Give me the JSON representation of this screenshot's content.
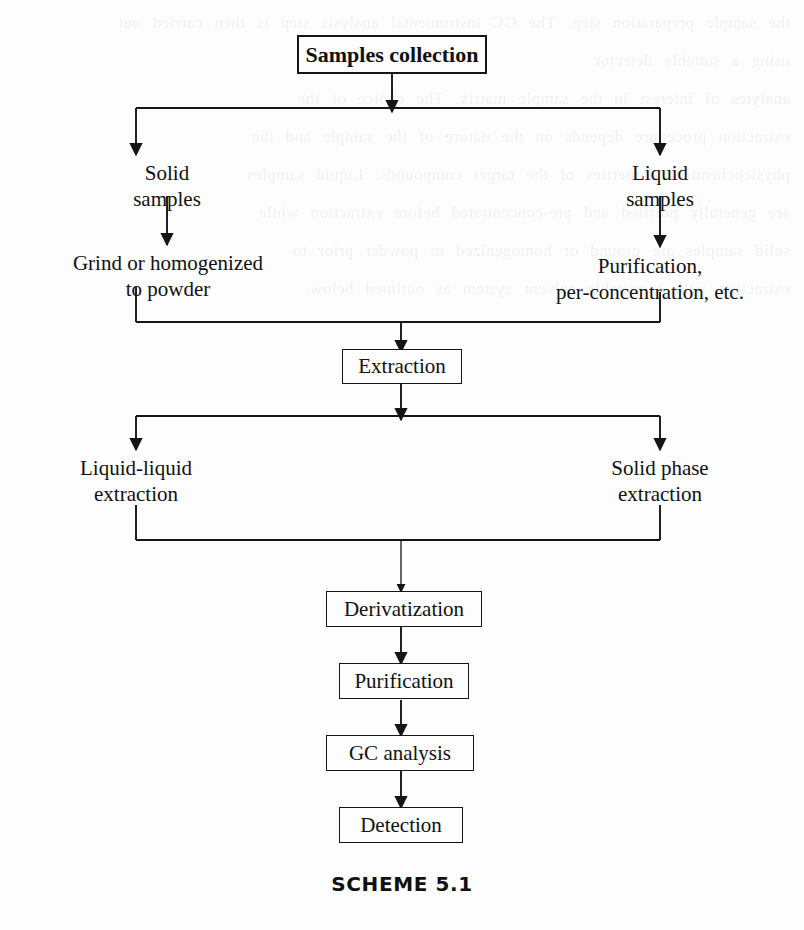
{
  "figure": {
    "caption": "SCHEME 5.1",
    "ghost_text": "the sample preparation step. The GC instrumental analysis step is then carried out\nusing a suitable detector\nanalytes of interest in the sample matrix. The choice of the\nextraction procedure depends on the nature of the sample and the\nphysicochemical properties of the target compounds. Liquid samples\nare generally purified and pre-concentrated before extraction while\nsolid samples are ground or homogenized to powder prior to\nextraction with a suitable solvent system as outlined below."
  },
  "nodes": {
    "samples_collection": "Samples collection",
    "solid_samples": "Solid\nsamples",
    "liquid_samples": "Liquid\nsamples",
    "grind_powder": "Grind or homogenized\nto powder",
    "purification_preconcentration": "Purification,\nper-concentration, etc.",
    "extraction": "Extraction",
    "liquid_liquid_extraction": "Liquid-liquid\nextraction",
    "solid_phase_extraction": "Solid phase\nextraction",
    "derivatization": "Derivatization",
    "purification": "Purification",
    "gc_analysis": "GC analysis",
    "detection": "Detection"
  },
  "style": {
    "line_color": "#151515",
    "background": "#fdfdfd",
    "text_color": "#111111"
  }
}
